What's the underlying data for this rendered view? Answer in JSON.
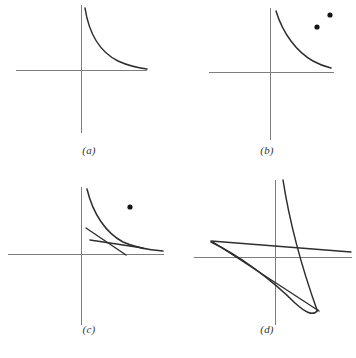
{
  "figure": {
    "background_color": "#ffffff",
    "axis_color": "#7d7d7d",
    "curve_color": "#2e2e2e",
    "point_color": "#161616",
    "width": 356,
    "height": 358
  },
  "panels": [
    {
      "id": "a",
      "label": "(a)",
      "origin": {
        "x": 81,
        "y": 70
      },
      "x_axis": {
        "x1": 16,
        "y1": 70,
        "x2": 147,
        "y2": 70
      },
      "y_axis": {
        "x1": 81,
        "y1": 5,
        "x2": 81,
        "y2": 133
      },
      "curves": [
        {
          "name": "hyperbola-branch",
          "path": "M 85 8 C 89 34, 100 52, 118 61 C 129 66, 139 68, 147 69"
        }
      ],
      "points": [],
      "secants": []
    },
    {
      "id": "b",
      "label": "(b)",
      "origin": {
        "x": 270,
        "y": 72
      },
      "x_axis": {
        "x1": 209,
        "y1": 72,
        "x2": 334,
        "y2": 72
      },
      "y_axis": {
        "x1": 270,
        "y1": 8,
        "x2": 270,
        "y2": 140
      },
      "curves": [
        {
          "name": "hyperbola-branch",
          "path": "M 276 11 C 283 34, 297 52, 313 61 C 320 65, 327 67, 331 68"
        }
      ],
      "points": [
        {
          "name": "sample-point-1",
          "x": 330,
          "y": 15,
          "r": 2.6
        },
        {
          "name": "sample-point-2",
          "x": 317,
          "y": 27,
          "r": 2.6
        }
      ],
      "secants": []
    },
    {
      "id": "c",
      "label": "(c)",
      "origin": {
        "x": 81,
        "y": 254
      },
      "x_axis": {
        "x1": 8,
        "y1": 254,
        "x2": 164,
        "y2": 254
      },
      "y_axis": {
        "x1": 81,
        "y1": 187,
        "x2": 81,
        "y2": 325
      },
      "curves": [
        {
          "name": "hyperbola-branch",
          "path": "M 87 189 C 93 214, 106 233, 123 242 C 136 248, 150 250, 163 251"
        }
      ],
      "points": [
        {
          "name": "sample-point-1",
          "x": 130,
          "y": 207,
          "r": 2.6
        }
      ],
      "secants": [
        {
          "name": "secant-line",
          "x1": 86,
          "y1": 228,
          "x2": 126,
          "y2": 255
        },
        {
          "name": "chord-line",
          "x1": 90,
          "y1": 240,
          "x2": 143,
          "y2": 248
        }
      ]
    },
    {
      "id": "d",
      "label": "(d)",
      "origin": {
        "x": 275,
        "y": 257
      },
      "x_axis": {
        "x1": 194,
        "y1": 257,
        "x2": 352,
        "y2": 257
      },
      "y_axis": {
        "x1": 275,
        "y1": 180,
        "x2": 275,
        "y2": 325
      },
      "curves": [
        {
          "name": "steep-hyperbola-branch",
          "path": "M 283 180 C 290 225, 302 268, 317 310"
        },
        {
          "name": "lower-arc",
          "path": "M 211 242 C 240 256, 272 280, 295 303 C 305 312, 313 317, 318 310"
        }
      ],
      "points": [],
      "secants": [
        {
          "name": "secant-line-upper",
          "x1": 211,
          "y1": 241,
          "x2": 351,
          "y2": 252
        },
        {
          "name": "secant-line-steep",
          "x1": 213,
          "y1": 242,
          "x2": 319,
          "y2": 311
        }
      ]
    }
  ]
}
